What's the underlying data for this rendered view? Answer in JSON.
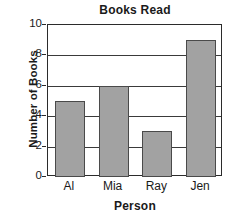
{
  "chart_data": {
    "type": "bar",
    "title": "Books Read",
    "xlabel": "Person",
    "ylabel": "Number of Books",
    "categories": [
      "Al",
      "Mia",
      "Ray",
      "Jen"
    ],
    "values": [
      5,
      6,
      3,
      9
    ],
    "ylim": [
      0,
      10
    ],
    "yticks": [
      0,
      2,
      4,
      6,
      8,
      10
    ],
    "ytick_labels": [
      "0",
      "2",
      "4",
      "6",
      "8",
      "10"
    ],
    "grid": true,
    "grid_axis": "y",
    "legend": null,
    "bar_color": "#a2a2a2",
    "bar_edge_color": "#4a4a4a",
    "axis_color": "#2b2b2b",
    "background": "#ffffff"
  }
}
